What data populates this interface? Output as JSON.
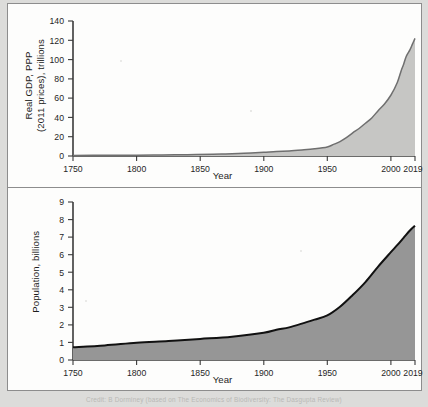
{
  "figure": {
    "background_color": "#dcdcda",
    "panel_color": "#fdfdfc",
    "border_color": "#8d8d8d",
    "caption": "Credit: B Dorminey (based on The Economics of Biodiversity: The Dasgupta Review)"
  },
  "chart_data": [
    {
      "id": "gdp",
      "type": "area",
      "title": "",
      "xlabel": "Year",
      "ylabel": "Real GDP, PPP (2011 prices), trillions",
      "ylabel_line1": "Real GDP, PPP",
      "ylabel_line2": "(2011 prices), trillions",
      "xlim": [
        1750,
        2019
      ],
      "ylim": [
        0,
        140
      ],
      "xticks": [
        1750,
        1800,
        1850,
        1900,
        1950,
        2000,
        2019
      ],
      "xtick_labels": [
        "1750",
        "1800",
        "1850",
        "1900",
        "1950",
        "2000",
        "2019"
      ],
      "yticks": [
        0,
        20,
        40,
        60,
        80,
        100,
        120,
        140
      ],
      "ytick_labels": [
        "0",
        "20",
        "40",
        "60",
        "80",
        "100",
        "120",
        "140"
      ],
      "grid": false,
      "fill_color": "#c6c6c4",
      "line_color": "#6f6f6f",
      "x": [
        1750,
        1775,
        1800,
        1820,
        1840,
        1860,
        1870,
        1880,
        1890,
        1900,
        1910,
        1920,
        1930,
        1940,
        1950,
        1955,
        1960,
        1965,
        1970,
        1975,
        1980,
        1985,
        1990,
        1995,
        2000,
        2005,
        2008,
        2010,
        2012,
        2015,
        2017,
        2019
      ],
      "values": [
        0.6,
        0.7,
        0.9,
        1.1,
        1.4,
        1.8,
        2.1,
        2.5,
        3.1,
        3.8,
        4.7,
        5.2,
        6.2,
        7.4,
        9.3,
        12.0,
        15.0,
        19.0,
        24.0,
        28.5,
        34.0,
        39.5,
        47.0,
        54.0,
        63.0,
        76.0,
        88.0,
        95.0,
        103.0,
        110.0,
        116.0,
        122.0
      ]
    },
    {
      "id": "population",
      "type": "area",
      "title": "",
      "xlabel": "Year",
      "ylabel": "Population, billions",
      "xlim": [
        1750,
        2019
      ],
      "ylim": [
        0,
        9
      ],
      "xticks": [
        1750,
        1800,
        1850,
        1900,
        1950,
        2000,
        2019
      ],
      "xtick_labels": [
        "1750",
        "1800",
        "1850",
        "1900",
        "1950",
        "2000",
        "2019"
      ],
      "yticks": [
        0,
        1,
        2,
        3,
        4,
        5,
        6,
        7,
        8,
        9
      ],
      "ytick_labels": [
        "0",
        "1",
        "2",
        "3",
        "4",
        "5",
        "6",
        "7",
        "8",
        "9"
      ],
      "grid": false,
      "fill_color": "#969696",
      "line_color": "#111111",
      "x": [
        1750,
        1775,
        1800,
        1825,
        1850,
        1875,
        1900,
        1910,
        1920,
        1930,
        1940,
        1950,
        1960,
        1970,
        1980,
        1990,
        2000,
        2005,
        2010,
        2015,
        2019
      ],
      "values": [
        0.73,
        0.83,
        0.98,
        1.08,
        1.2,
        1.33,
        1.55,
        1.72,
        1.86,
        2.07,
        2.3,
        2.54,
        3.03,
        3.7,
        4.44,
        5.32,
        6.14,
        6.54,
        6.96,
        7.38,
        7.65
      ]
    }
  ]
}
